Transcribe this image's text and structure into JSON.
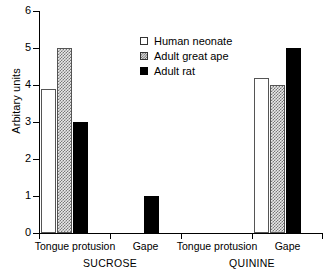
{
  "chart_data": {
    "type": "bar",
    "title": "",
    "xlabel": "",
    "ylabel": "Arbitary units",
    "ylim": [
      0,
      6
    ],
    "ytick_labels": [
      "0",
      "1",
      "2",
      "3",
      "4",
      "5",
      "6"
    ],
    "ytick_values": [
      0,
      1,
      2,
      3,
      4,
      5,
      6
    ],
    "grid": false,
    "legend_position": "upper-center",
    "categories": [
      "Tongue protusion",
      "Gape",
      "Tongue protusion",
      "Gape"
    ],
    "group_conditions": [
      "SUCROSE",
      "QUININE"
    ],
    "series": [
      {
        "name": "Human neonate",
        "values": [
          3.9,
          0.0,
          0.0,
          4.2
        ],
        "fill": "open"
      },
      {
        "name": "Adult great ape",
        "values": [
          5.0,
          0.0,
          0.0,
          4.0
        ],
        "fill": "hatched"
      },
      {
        "name": "Adult rat",
        "values": [
          3.0,
          1.0,
          0.0,
          5.0
        ],
        "fill": "solid"
      }
    ]
  },
  "axes": {
    "y": {
      "label": "Arbitary units",
      "ticks": [
        "6",
        "5",
        "4",
        "3",
        "2",
        "1",
        "0"
      ]
    },
    "x": {
      "groups": [
        {
          "behaviour": "Tongue protusion",
          "condition": "SUCROSE"
        },
        {
          "behaviour": "Gape",
          "condition": "SUCROSE"
        },
        {
          "behaviour": "Tongue protusion",
          "condition": "QUININE"
        },
        {
          "behaviour": "Gape",
          "condition": "QUININE"
        }
      ],
      "condition_labels": [
        "SUCROSE",
        "QUININE"
      ]
    }
  },
  "legend": {
    "entries": [
      {
        "label": "Human neonate",
        "marker": "open-square-icon"
      },
      {
        "label": "Adult great ape",
        "marker": "hatched-square-icon"
      },
      {
        "label": "Adult rat",
        "marker": "filled-square-icon"
      }
    ]
  },
  "colors": {
    "axis": "#000000",
    "open_fill": "#ffffff",
    "open_stroke": "#555555",
    "hatch_base": "#e9e9e9",
    "hatch_line": "#777777",
    "solid_fill": "#000000"
  }
}
